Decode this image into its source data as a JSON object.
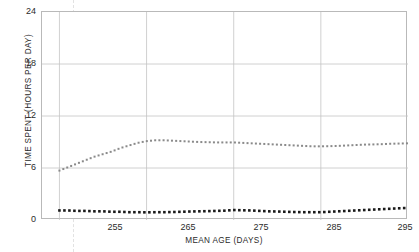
{
  "chart_data": {
    "type": "line",
    "title": "",
    "xlabel": "MEAN AGE (DAYS)",
    "ylabel": "TIME SPENT (HOURS PER DAY)",
    "xlim": [
      253,
      295
    ],
    "ylim": [
      0,
      24
    ],
    "xticks": [
      255,
      265,
      275,
      285,
      295
    ],
    "yticks": [
      0,
      6,
      12,
      18,
      24
    ],
    "grid": true,
    "legend": "none",
    "x": [
      255,
      256,
      257,
      258,
      259,
      260,
      261,
      262,
      263,
      264,
      265,
      266,
      267,
      268,
      269,
      270,
      271,
      272,
      273,
      274,
      275,
      276,
      277,
      278,
      279,
      280,
      281,
      282,
      283,
      284,
      285,
      286,
      287,
      288,
      289,
      290,
      291,
      292,
      293,
      294,
      295
    ],
    "series": [
      {
        "name": "gray-dotted-series",
        "color": "#8a8a8a",
        "style": "dotted",
        "values": [
          5.7,
          6.1,
          6.5,
          6.9,
          7.3,
          7.6,
          7.9,
          8.3,
          8.6,
          8.9,
          9.1,
          9.2,
          9.2,
          9.15,
          9.1,
          9.05,
          9.0,
          8.98,
          8.95,
          8.95,
          8.95,
          8.9,
          8.85,
          8.8,
          8.75,
          8.7,
          8.65,
          8.6,
          8.55,
          8.5,
          8.5,
          8.52,
          8.55,
          8.6,
          8.65,
          8.7,
          8.72,
          8.75,
          8.8,
          8.82,
          8.85
        ]
      },
      {
        "name": "black-dotted-series",
        "color": "#1a1a1a",
        "style": "dotted",
        "values": [
          1.1,
          1.1,
          1.05,
          1.05,
          1.0,
          1.0,
          0.95,
          0.95,
          0.9,
          0.9,
          0.88,
          0.9,
          0.9,
          0.92,
          0.95,
          0.98,
          1.0,
          1.02,
          1.05,
          1.08,
          1.15,
          1.12,
          1.1,
          1.05,
          1.0,
          0.98,
          0.95,
          0.92,
          0.9,
          0.9,
          0.9,
          0.95,
          1.0,
          1.05,
          1.1,
          1.15,
          1.2,
          1.25,
          1.3,
          1.35,
          1.4
        ]
      }
    ]
  },
  "axes": {
    "y_tick_labels": [
      "24",
      "18",
      "12",
      "6",
      "0"
    ],
    "x_tick_labels": [
      "255",
      "265",
      "275",
      "285",
      "295"
    ]
  }
}
